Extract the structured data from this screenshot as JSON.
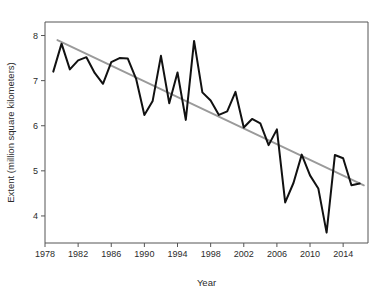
{
  "chart_data": {
    "type": "line",
    "title": "",
    "xlabel": "Year",
    "ylabel": "Extent (million square kilometers)",
    "xlim": [
      1978,
      2017
    ],
    "ylim": [
      3.4,
      8.3
    ],
    "grid": false,
    "legend": "none",
    "x_ticks": [
      1978,
      1982,
      1986,
      1990,
      1994,
      1998,
      2002,
      2006,
      2010,
      2014
    ],
    "y_ticks": [
      4,
      5,
      6,
      7,
      8
    ],
    "x": [
      1979,
      1980,
      1981,
      1982,
      1983,
      1984,
      1985,
      1986,
      1987,
      1988,
      1989,
      1990,
      1991,
      1992,
      1993,
      1994,
      1995,
      1996,
      1997,
      1998,
      1999,
      2000,
      2001,
      2002,
      2003,
      2004,
      2005,
      2006,
      2007,
      2008,
      2009,
      2010,
      2011,
      2012,
      2013,
      2014,
      2015,
      2016
    ],
    "series": [
      {
        "name": "Sea ice extent",
        "color": "#111111",
        "values": [
          7.2,
          7.82,
          7.25,
          7.45,
          7.52,
          7.17,
          6.93,
          7.41,
          7.5,
          7.49,
          7.04,
          6.24,
          6.55,
          7.55,
          6.5,
          7.18,
          6.13,
          7.88,
          6.74,
          6.56,
          6.24,
          6.32,
          6.75,
          5.96,
          6.15,
          6.05,
          5.57,
          5.92,
          4.3,
          4.73,
          5.36,
          4.9,
          4.61,
          3.63,
          5.35,
          5.28,
          4.68,
          4.72
        ]
      }
    ],
    "trend": {
      "name": "Linear trend",
      "color": "#9a9a9a",
      "x_start": 1979.5,
      "y_start": 7.9,
      "x_end": 2016.5,
      "y_end": 4.68
    }
  },
  "figure": {
    "frame_color": "#555555",
    "background": "#ffffff"
  }
}
